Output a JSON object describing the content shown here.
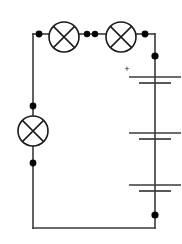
{
  "figure": {
    "type": "electrical-schematic",
    "background_color": "#ffffff",
    "wire_color": "#3a3a3a",
    "symbol_color": "#1a1a1a",
    "node_color": "#050505",
    "width": 182,
    "height": 244
  },
  "labels": {
    "positive_terminal": "+"
  },
  "components": {
    "lamps": [
      {
        "id": "lamp-top-left",
        "symbol": "lamp-icon",
        "orientation": "horizontal",
        "cx": 64,
        "cy": 37,
        "r": 15
      },
      {
        "id": "lamp-top-right",
        "symbol": "lamp-icon",
        "orientation": "horizontal",
        "cx": 121,
        "cy": 37,
        "r": 15
      },
      {
        "id": "lamp-left",
        "symbol": "lamp-icon",
        "orientation": "vertical",
        "cx": 33,
        "cy": 131,
        "r": 15
      }
    ],
    "battery": {
      "id": "battery-right",
      "symbol": "battery-icon",
      "cell_count": 3,
      "x_center": 155,
      "long_plate_half_width": 26,
      "short_plate_half_width": 16,
      "cells": [
        {
          "long_plate_y": 77,
          "short_plate_y": 83
        },
        {
          "long_plate_y": 133,
          "short_plate_y": 139
        },
        {
          "long_plate_y": 185,
          "short_plate_y": 191
        }
      ],
      "polarity_marker": {
        "text": "+",
        "x": 127,
        "y": 70
      }
    },
    "nodes": [
      {
        "id": "node-top-left-corner",
        "cx": 39,
        "cy": 34,
        "r": 3.4
      },
      {
        "id": "node-lamp-top-left-right",
        "cx": 87,
        "cy": 34,
        "r": 3.2
      },
      {
        "id": "node-between-lamps-a",
        "cx": 95,
        "cy": 34,
        "r": 3.2
      },
      {
        "id": "node-top-right-corner",
        "cx": 145,
        "cy": 34,
        "r": 3.4
      },
      {
        "id": "node-battery-top",
        "cx": 155,
        "cy": 56,
        "r": 3.6
      },
      {
        "id": "node-battery-bottom",
        "cx": 155,
        "cy": 215,
        "r": 3.6
      },
      {
        "id": "node-lamp-left-above",
        "cx": 33,
        "cy": 106,
        "r": 3.4
      },
      {
        "id": "node-lamp-left-below",
        "cx": 33,
        "cy": 163,
        "r": 3.4
      }
    ],
    "wires": [
      {
        "id": "wire-top-left-segment",
        "d": "M 33 34 L 49 34"
      },
      {
        "id": "wire-between-lamps",
        "d": "M 79 34 L 106 34"
      },
      {
        "id": "wire-top-right-segment",
        "d": "M 136 34 L 155 34"
      },
      {
        "id": "wire-right-vertical",
        "d": "M 155 34 L 155 228"
      },
      {
        "id": "wire-bottom",
        "d": "M 33 228 L 155 228"
      },
      {
        "id": "wire-left-upper",
        "d": "M 33 34 L 33 116"
      },
      {
        "id": "wire-left-lower",
        "d": "M 33 146 L 33 228"
      }
    ]
  }
}
